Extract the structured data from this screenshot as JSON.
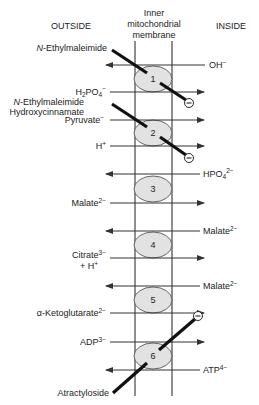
{
  "headers": {
    "outside": "OUTSIDE",
    "membrane_line1": "Inner",
    "membrane_line2": "mitochondrial",
    "membrane_line3": "membrane",
    "inside": "INSIDE"
  },
  "colors": {
    "line": "#333333",
    "carrier_fill": "#e2e2e2",
    "inhibitor": "#111111"
  },
  "carriers": [
    {
      "id": "1",
      "label": "1"
    },
    {
      "id": "2",
      "label": "2"
    },
    {
      "id": "3",
      "label": "3"
    },
    {
      "id": "4",
      "label": "4"
    },
    {
      "id": "5",
      "label": "5"
    },
    {
      "id": "6",
      "label": "6"
    }
  ],
  "transports": [
    {
      "carrier": "1",
      "side": "inside",
      "direction": "to-outside",
      "main": "OH",
      "sup": "−"
    },
    {
      "carrier": "1",
      "side": "outside",
      "direction": "to-inside",
      "main": "H",
      "sub": "2",
      "main2": "PO",
      "sub2": "4",
      "sup": "−"
    },
    {
      "carrier": "2",
      "side": "outside",
      "direction": "to-inside",
      "main": "Pyruvate",
      "sup": "−"
    },
    {
      "carrier": "2",
      "side": "outside",
      "direction": "to-inside",
      "main": "H",
      "sup": "+"
    },
    {
      "carrier": "3",
      "side": "inside",
      "direction": "to-outside",
      "main": "HPO",
      "sub": "4",
      "sup": "2−"
    },
    {
      "carrier": "3",
      "side": "outside",
      "direction": "to-inside",
      "main": "Malate",
      "sup": "2−"
    },
    {
      "carrier": "4",
      "side": "inside",
      "direction": "to-outside",
      "main": "Malate",
      "sup": "2−"
    },
    {
      "carrier": "4",
      "side": "outside",
      "direction": "to-inside",
      "main": "Citrate",
      "sup": "3−",
      "line2": "+ H",
      "line2_sup": "+"
    },
    {
      "carrier": "5",
      "side": "inside",
      "direction": "to-outside",
      "main": "Malate",
      "sup": "2−"
    },
    {
      "carrier": "5",
      "side": "outside",
      "direction": "to-inside",
      "main": "α-Ketoglutarate",
      "sup": "2−"
    },
    {
      "carrier": "6",
      "side": "outside",
      "direction": "to-inside",
      "main": "ADP",
      "sup": "3−"
    },
    {
      "carrier": "6",
      "side": "inside",
      "direction": "to-outside",
      "main": "ATP",
      "sup": "4−"
    }
  ],
  "inhibitors": [
    {
      "carrier": "1",
      "italic_prefix": "N",
      "rest": "-Ethylmaleimide",
      "symbol": "−"
    },
    {
      "carrier": "2",
      "line1_italic_prefix": "N",
      "line1_rest": "-Ethylmaleimide",
      "line2": "Hydroxycinnamate",
      "symbol": "−"
    },
    {
      "carrier": "6",
      "rest": "Atractyloside",
      "symbol": "−"
    }
  ]
}
